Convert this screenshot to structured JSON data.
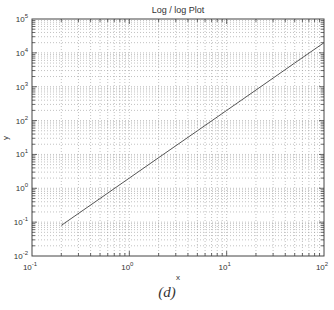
{
  "chart_data": {
    "type": "line",
    "title": "Log / log Plot",
    "xlabel": "x",
    "ylabel": "y",
    "xscale": "log",
    "yscale": "log",
    "xlim": [
      0.1,
      100
    ],
    "ylim": [
      0.01,
      100000
    ],
    "grid": true,
    "minor_grid": true,
    "x_ticks": [
      "10^-1",
      "10^0",
      "10^1",
      "10^2"
    ],
    "y_ticks": [
      "10^-2",
      "10^-1",
      "10^0",
      "10^1",
      "10^2",
      "10^3",
      "10^4",
      "10^5"
    ],
    "series": [
      {
        "name": "y = 2x^2",
        "x": [
          0.2,
          0.5,
          1,
          2,
          5,
          10,
          20,
          50,
          100
        ],
        "y": [
          0.08,
          0.5,
          2,
          8,
          50,
          200,
          800,
          5000,
          20000
        ]
      }
    ],
    "legend": null
  },
  "caption": "(d)"
}
